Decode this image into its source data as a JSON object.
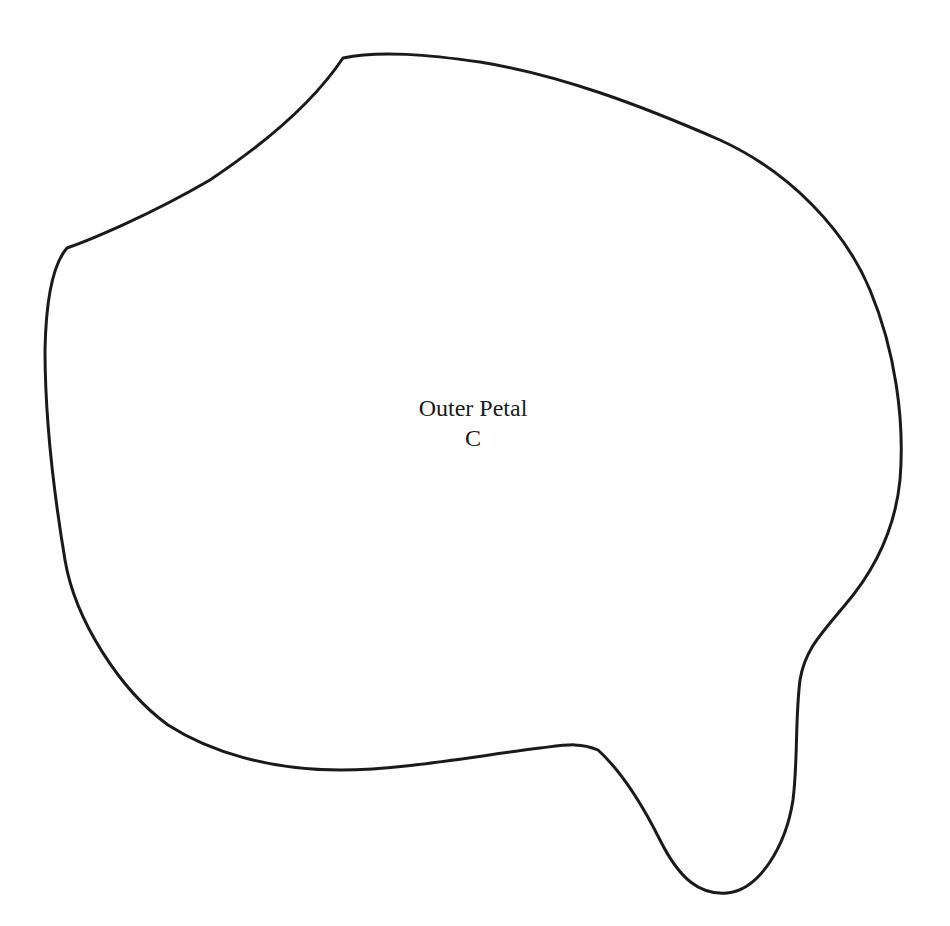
{
  "pattern": {
    "piece_name": "Outer Petal",
    "piece_letter": "C",
    "outline_color": "#1a1a1a",
    "background_color": "#ffffff"
  }
}
